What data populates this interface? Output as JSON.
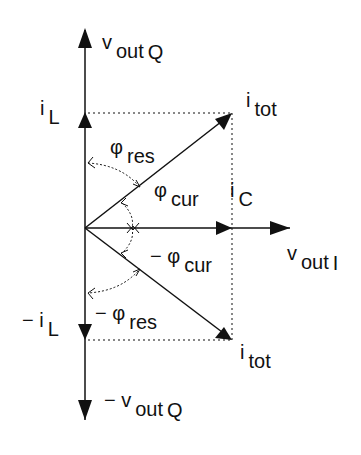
{
  "diagram": {
    "colors": {
      "line": "#111111",
      "background": "#ffffff"
    },
    "labels": {
      "vout_q": {
        "main": "v",
        "sub": "out",
        "sub2": "Q"
      },
      "il": {
        "main": "i",
        "sub": "L"
      },
      "itot_top": {
        "main": "i",
        "sub": "tot"
      },
      "phi_res": {
        "main": "φ",
        "sub": "res"
      },
      "phi_cur": {
        "main": "φ",
        "sub": "cur"
      },
      "ic": {
        "main": "i",
        "sub": "C"
      },
      "vout_i": {
        "main": "v",
        "sub": "out",
        "sub2": "I"
      },
      "neg_phi_cur": {
        "main": "− φ",
        "sub": "cur"
      },
      "neg_phi_res": {
        "main": "− φ",
        "sub": "res"
      },
      "neg_il": {
        "main": "− i",
        "sub": "L"
      },
      "itot_bot": {
        "main": "i",
        "sub": "tot"
      },
      "neg_vout_q": {
        "main": "− v",
        "sub": "out",
        "sub2": "Q"
      }
    }
  }
}
